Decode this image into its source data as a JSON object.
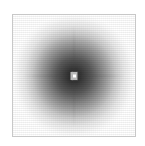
{
  "figure": {
    "title": "",
    "background_color": "#ffffff",
    "frame_color": "#c8c8c8",
    "frame": {
      "x": 12,
      "y": 14,
      "width": 124,
      "height": 123
    }
  },
  "chart_data": {
    "type": "heatmap",
    "title": "",
    "subtitle": "",
    "xlabel": "",
    "ylabel": "",
    "colormap": "gray_inverted",
    "colormap_low_color": "#ffffff",
    "colormap_high_color": "#1e1e1e",
    "grid": false,
    "legend": false,
    "colorbar": false,
    "axis_ticks_visible": false,
    "axis_tick_labels": [],
    "xlim": [
      0,
      124
    ],
    "ylim": [
      0,
      123
    ],
    "center": {
      "x": 62,
      "y": 61
    },
    "peak_value": 1.0,
    "background_value": 0.0,
    "core": {
      "label": "saturated-core",
      "width_px": 7,
      "height_px": 8,
      "pattern": "checkerboard",
      "bright_color": "#ffffff",
      "dark_color": "#6e6e6e"
    },
    "radial_profile": {
      "radius_px": [
        0,
        5,
        10,
        18,
        26,
        34,
        42,
        50,
        58,
        62
      ],
      "intensity": [
        1.0,
        0.96,
        0.92,
        0.85,
        0.74,
        0.61,
        0.45,
        0.29,
        0.12,
        0.0
      ],
      "gray_level": [
        30,
        40,
        50,
        66,
        90,
        116,
        150,
        186,
        222,
        255
      ]
    },
    "streaks": [
      {
        "name": "horizontal-streak",
        "orientation": "horizontal",
        "length_px": 104,
        "intensity": 0.16
      },
      {
        "name": "vertical-streak",
        "orientation": "vertical",
        "length_px": 104,
        "intensity": 0.16
      }
    ],
    "texture": {
      "name": "dither-noise",
      "type": "pixel-dither",
      "opacity": 0.1
    }
  }
}
